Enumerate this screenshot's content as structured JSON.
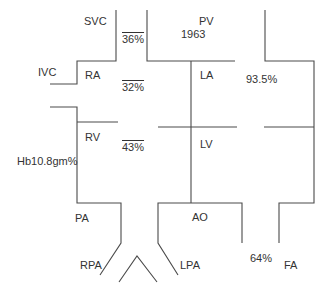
{
  "diagram": {
    "type": "cardiac catheterization oxygen saturation diagram",
    "chambers": {
      "svc": "SVC",
      "ivc": "IVC",
      "ra": "RA",
      "rv": "RV",
      "pa": "PA",
      "rpa": "RPA",
      "lpa": "LPA",
      "pv": "PV",
      "la": "LA",
      "lv": "LV",
      "ao": "AO",
      "fa": "FA"
    },
    "values": {
      "svc_sat": "36%",
      "ra_sat": "32%",
      "rv_sat": "43%",
      "pv_year": "1963",
      "la_sat": "93.5%",
      "fa_sat": "64%",
      "hemoglobin": "Hb10.8gm%"
    },
    "line_color": "#4a4a4a",
    "text_color": "#333333"
  }
}
